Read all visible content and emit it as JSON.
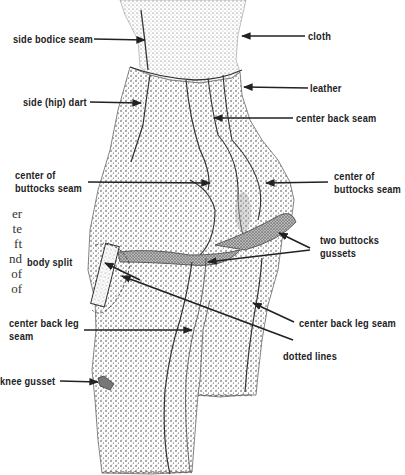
{
  "figure": {
    "labels": {
      "side_bodice_seam": "side bodice seam",
      "cloth": "cloth",
      "leather": "leather",
      "side_hip_dart": "side (hip) dart",
      "center_back_seam": "center back seam",
      "center_of_buttocks_seam_left_1": "center of",
      "center_of_buttocks_seam_left_2": "buttocks seam",
      "center_of_buttocks_seam_right_1": "center of",
      "center_of_buttocks_seam_right_2": "buttocks seam",
      "two_buttocks_gussets_1": "two buttocks",
      "two_buttocks_gussets_2": "gussets",
      "body_split": "body split",
      "center_back_leg_seam_left_1": "center back leg",
      "center_back_leg_seam_left_2": "seam",
      "center_back_leg_seam_right": "center back leg seam",
      "dotted_lines": "dotted lines",
      "knee_gusset": "knee gusset"
    },
    "cropped_margin_text": [
      "er",
      "te",
      "ft",
      "nd",
      "of",
      "of"
    ]
  }
}
